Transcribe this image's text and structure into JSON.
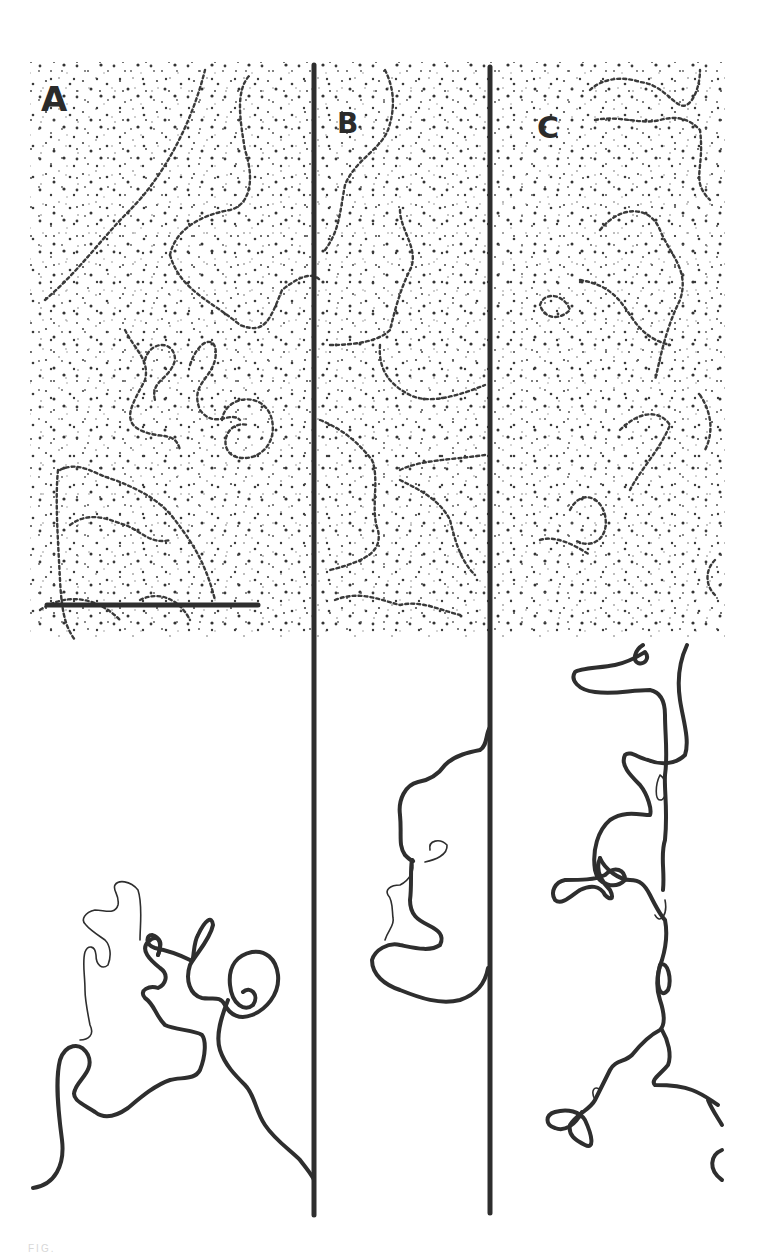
{
  "figure": {
    "panels": [
      {
        "id": "A",
        "label": "A",
        "description": "Electron micrograph of DNA molecule with tracing below",
        "has_scale_bar": true
      },
      {
        "id": "B",
        "label": "B",
        "description": "Electron micrograph of DNA molecule with tracing below"
      },
      {
        "id": "C",
        "label": "C",
        "description": "Electron micrograph of DNA molecule with tracing below"
      }
    ],
    "scale_bar": {
      "panel": "A",
      "x1": 47,
      "x2": 258,
      "y": 605
    },
    "dividers": [
      {
        "x": 314,
        "y1": 65,
        "y2": 1215
      },
      {
        "x": 490,
        "y1": 67,
        "y2": 1213
      }
    ],
    "caption_fragment": "FIG.",
    "colors": {
      "ink": "#2e2e2e",
      "background": "#ffffff",
      "speckle": "#3a3a3a"
    }
  }
}
